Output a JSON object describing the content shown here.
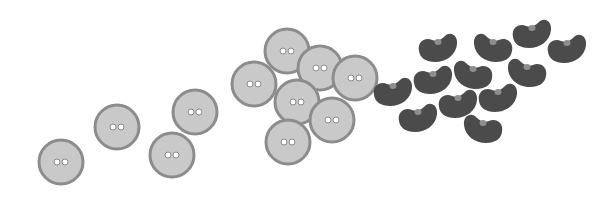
{
  "scene": {
    "description": "Illustration of round two-hole buttons and kidney beans",
    "colors": {
      "background": "#ffffff",
      "button_fill": "#c9c9c9",
      "button_rim": "#8c8c8c",
      "button_hole_fill": "#ffffff",
      "button_hole_stroke": "#8a8a8a",
      "bean_fill": "#4b4b4b",
      "bean_hilum": "#8e8e8e"
    },
    "buttons": [
      {
        "x": 61,
        "y": 162,
        "r": 23
      },
      {
        "x": 117,
        "y": 127,
        "r": 23
      },
      {
        "x": 172,
        "y": 155,
        "r": 23
      },
      {
        "x": 195,
        "y": 112,
        "r": 23
      },
      {
        "x": 254,
        "y": 84,
        "r": 23
      },
      {
        "x": 287,
        "y": 51,
        "r": 23
      },
      {
        "x": 320,
        "y": 68,
        "r": 23
      },
      {
        "x": 355,
        "y": 78,
        "r": 23
      },
      {
        "x": 297,
        "y": 102,
        "r": 23
      },
      {
        "x": 332,
        "y": 120,
        "r": 23
      },
      {
        "x": 288,
        "y": 142,
        "r": 23
      }
    ],
    "beans": [
      {
        "x": 393,
        "y": 91,
        "flip": false
      },
      {
        "x": 438,
        "y": 47,
        "flip": false
      },
      {
        "x": 433,
        "y": 79,
        "flip": false
      },
      {
        "x": 418,
        "y": 117,
        "flip": false
      },
      {
        "x": 458,
        "y": 103,
        "flip": false
      },
      {
        "x": 473,
        "y": 74,
        "flip": true
      },
      {
        "x": 493,
        "y": 47,
        "flip": true
      },
      {
        "x": 498,
        "y": 97,
        "flip": false
      },
      {
        "x": 527,
        "y": 72,
        "flip": true
      },
      {
        "x": 532,
        "y": 33,
        "flip": false
      },
      {
        "x": 483,
        "y": 128,
        "flip": true
      },
      {
        "x": 567,
        "y": 48,
        "flip": false
      }
    ]
  }
}
